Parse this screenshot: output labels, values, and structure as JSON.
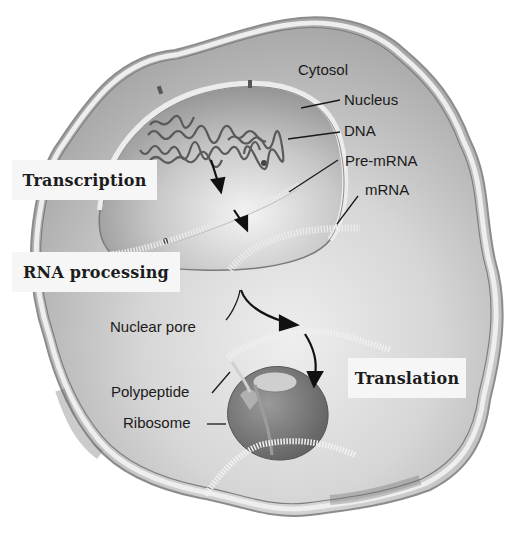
{
  "diagram": {
    "structure_labels": {
      "cytosol": "Cytosol",
      "nucleus": "Nucleus",
      "dna": "DNA",
      "pre_mrna": "Pre-mRNA",
      "mrna": "mRNA",
      "nuclear_pore": "Nuclear pore",
      "polypeptide": "Polypeptide",
      "ribosome": "Ribosome"
    },
    "process_steps": [
      {
        "label": "Transcription"
      },
      {
        "label": "RNA processing"
      },
      {
        "label": "Translation"
      }
    ],
    "colors": {
      "background": "#ffffff",
      "cytoplasm": "#bdbdbd",
      "nucleoplasm": "#a9a9a9",
      "membrane": "#e8e8e8",
      "rna_strand": "#efefef",
      "ribosome": "#7a7a7a",
      "arrow": "#111111",
      "label_box": "#f6f6f6"
    }
  }
}
